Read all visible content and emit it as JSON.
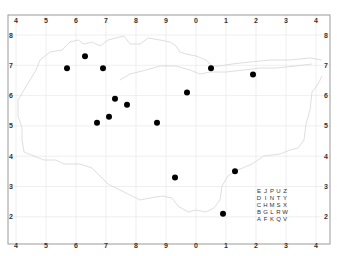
{
  "map": {
    "title": "",
    "x_ticks": [
      "4",
      "5",
      "6",
      "7",
      "8",
      "9",
      "0",
      "1",
      "2",
      "3",
      "4"
    ],
    "y_ticks": [
      "8",
      "7",
      "6",
      "5",
      "4",
      "3",
      "2"
    ],
    "colors": {
      "frame": "#9a9a9a",
      "grid": "#e4e4e4",
      "coastline": "#d6d6d6",
      "point": "#000000",
      "label": "#333333"
    },
    "points_grid_units": [
      {
        "x": 5.7,
        "y": 6.9
      },
      {
        "x": 6.3,
        "y": 7.3
      },
      {
        "x": 6.9,
        "y": 6.9
      },
      {
        "x": 7.3,
        "y": 5.9
      },
      {
        "x": 7.7,
        "y": 5.7
      },
      {
        "x": 7.1,
        "y": 5.3
      },
      {
        "x": 6.7,
        "y": 5.1
      },
      {
        "x": 8.7,
        "y": 5.1
      },
      {
        "x": 10.5,
        "y": 6.9
      },
      {
        "x": 11.9,
        "y": 6.7
      },
      {
        "x": 9.7,
        "y": 6.1
      },
      {
        "x": 9.3,
        "y": 3.3
      },
      {
        "x": 11.3,
        "y": 3.5
      },
      {
        "x": 10.9,
        "y": 2.1
      }
    ],
    "letter_grid": [
      [
        "E",
        "J",
        "P",
        "U",
        "Z"
      ],
      [
        "D",
        "I",
        "N",
        "T",
        "Y"
      ],
      [
        "C",
        "H",
        "M",
        "S",
        "X"
      ],
      [
        "B",
        "G",
        "L",
        "R",
        "W"
      ],
      [
        "A",
        "F",
        "K",
        "Q",
        "V"
      ]
    ]
  }
}
